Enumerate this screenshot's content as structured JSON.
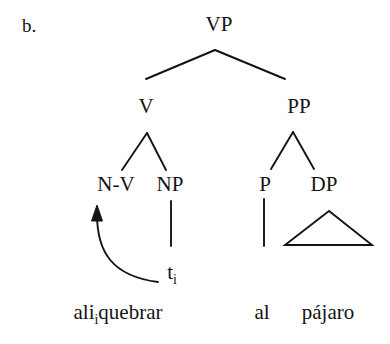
{
  "figure": {
    "item_label": "b.",
    "kind": "syntax-tree",
    "ink_color": "#141414",
    "background_color": "#ffffff"
  },
  "nodes": {
    "root": "VP",
    "v": "V",
    "pp": "PP",
    "nv": "N-V",
    "np": "NP",
    "p": "P",
    "dp": "DP"
  },
  "trace": {
    "symbol": "t",
    "index": "i"
  },
  "terminals": {
    "left_stem": "ali",
    "left_index": "i",
    "left_verb": "quebrar",
    "right_prep": "al",
    "right_noun": "pájaro"
  },
  "annotations": {
    "movement_arrow": "movement from trace t-i to N-V head"
  }
}
